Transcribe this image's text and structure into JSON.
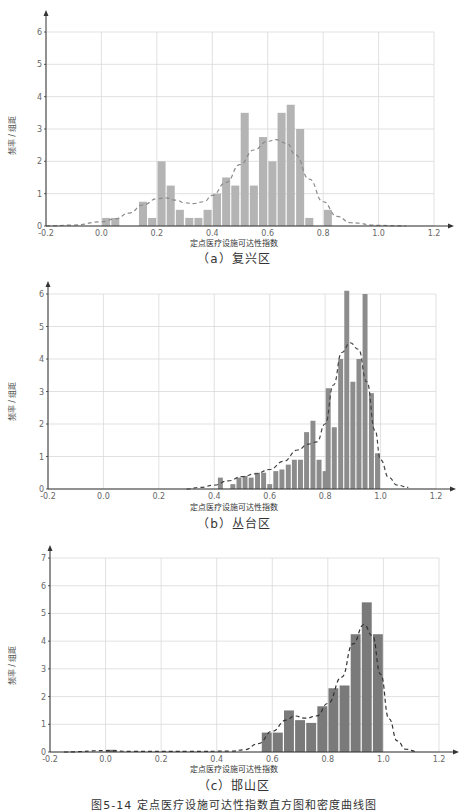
{
  "figure_caption": "图5-14  定点医疗设施可达性指数直方图和密度曲线图",
  "chart_data": [
    {
      "type": "bar",
      "subtype": "histogram_with_density_curve",
      "caption": "（a）复兴区",
      "xlabel": "定点医疗设施可达性指数",
      "ylabel": "频率 / 组距",
      "xlim": [
        -0.2,
        1.2
      ],
      "ylim": [
        0,
        6
      ],
      "xticks": [
        "-0.2",
        "0.0",
        "0.2",
        "0.4",
        "0.6",
        "0.8",
        "1.0",
        "1.2"
      ],
      "yticks": [
        "0",
        "1",
        "2",
        "3",
        "4",
        "5",
        "6"
      ],
      "grid": true,
      "bin_width": 0.0333,
      "bar_color": "#b4b4b4",
      "bins": [
        {
          "x": 0.017,
          "y": 0.25
        },
        {
          "x": 0.05,
          "y": 0.25
        },
        {
          "x": 0.15,
          "y": 0.75
        },
        {
          "x": 0.183,
          "y": 0.25
        },
        {
          "x": 0.217,
          "y": 2.0
        },
        {
          "x": 0.25,
          "y": 1.25
        },
        {
          "x": 0.283,
          "y": 0.5
        },
        {
          "x": 0.317,
          "y": 0.25
        },
        {
          "x": 0.35,
          "y": 0.25
        },
        {
          "x": 0.383,
          "y": 0.5
        },
        {
          "x": 0.417,
          "y": 1.0
        },
        {
          "x": 0.45,
          "y": 1.5
        },
        {
          "x": 0.483,
          "y": 1.25
        },
        {
          "x": 0.517,
          "y": 3.5
        },
        {
          "x": 0.55,
          "y": 1.25
        },
        {
          "x": 0.583,
          "y": 2.75
        },
        {
          "x": 0.617,
          "y": 2.0
        },
        {
          "x": 0.65,
          "y": 3.5
        },
        {
          "x": 0.683,
          "y": 3.75
        },
        {
          "x": 0.717,
          "y": 3.0
        },
        {
          "x": 0.75,
          "y": 0.25
        },
        {
          "x": 0.817,
          "y": 0.5
        }
      ],
      "density_curve": {
        "style": "dashed",
        "color": "#8a8a8a",
        "points": [
          [
            -0.2,
            0.0
          ],
          [
            -0.1,
            0.03
          ],
          [
            0.0,
            0.13
          ],
          [
            0.05,
            0.22
          ],
          [
            0.1,
            0.4
          ],
          [
            0.15,
            0.65
          ],
          [
            0.2,
            0.84
          ],
          [
            0.23,
            0.87
          ],
          [
            0.27,
            0.8
          ],
          [
            0.3,
            0.72
          ],
          [
            0.33,
            0.69
          ],
          [
            0.37,
            0.75
          ],
          [
            0.4,
            0.95
          ],
          [
            0.45,
            1.35
          ],
          [
            0.5,
            1.9
          ],
          [
            0.55,
            2.35
          ],
          [
            0.6,
            2.62
          ],
          [
            0.63,
            2.67
          ],
          [
            0.67,
            2.55
          ],
          [
            0.7,
            2.2
          ],
          [
            0.75,
            1.45
          ],
          [
            0.8,
            0.75
          ],
          [
            0.85,
            0.3
          ],
          [
            0.9,
            0.1
          ],
          [
            1.0,
            0.02
          ],
          [
            1.1,
            0.0
          ]
        ]
      }
    },
    {
      "type": "bar",
      "subtype": "histogram_with_density_curve",
      "caption": "（b）丛台区",
      "xlabel": "定点医疗设施可达性指数",
      "ylabel": "频率 / 组距",
      "xlim": [
        -0.2,
        1.2
      ],
      "ylim": [
        0,
        6
      ],
      "xticks": [
        "-0.2",
        "0.0",
        "0.2",
        "0.4",
        "0.6",
        "0.8",
        "1.0",
        "1.2"
      ],
      "yticks": [
        "0",
        "1",
        "2",
        "3",
        "4",
        "5",
        "6"
      ],
      "grid": true,
      "bin_width": 0.0222,
      "bar_color": "#8c8c8c",
      "bins": [
        {
          "x": 0.422,
          "y": 0.35
        },
        {
          "x": 0.467,
          "y": 0.15
        },
        {
          "x": 0.489,
          "y": 0.35
        },
        {
          "x": 0.511,
          "y": 0.4
        },
        {
          "x": 0.533,
          "y": 0.35
        },
        {
          "x": 0.556,
          "y": 0.5
        },
        {
          "x": 0.578,
          "y": 0.5
        },
        {
          "x": 0.6,
          "y": 0.15
        },
        {
          "x": 0.622,
          "y": 0.55
        },
        {
          "x": 0.644,
          "y": 0.6
        },
        {
          "x": 0.667,
          "y": 0.75
        },
        {
          "x": 0.689,
          "y": 0.9
        },
        {
          "x": 0.711,
          "y": 0.9
        },
        {
          "x": 0.733,
          "y": 1.75
        },
        {
          "x": 0.756,
          "y": 2.1
        },
        {
          "x": 0.778,
          "y": 0.9
        },
        {
          "x": 0.8,
          "y": 0.55
        },
        {
          "x": 0.811,
          "y": 3.1
        },
        {
          "x": 0.833,
          "y": 1.9
        },
        {
          "x": 0.856,
          "y": 4.0
        },
        {
          "x": 0.878,
          "y": 6.1
        },
        {
          "x": 0.9,
          "y": 3.3
        },
        {
          "x": 0.922,
          "y": 4.0
        },
        {
          "x": 0.944,
          "y": 6.0
        },
        {
          "x": 0.967,
          "y": 2.95
        },
        {
          "x": 0.989,
          "y": 1.1
        }
      ],
      "density_curve": {
        "style": "dashed",
        "color": "#444444",
        "points": [
          [
            0.3,
            0.0
          ],
          [
            0.35,
            0.05
          ],
          [
            0.4,
            0.12
          ],
          [
            0.45,
            0.25
          ],
          [
            0.5,
            0.38
          ],
          [
            0.55,
            0.47
          ],
          [
            0.6,
            0.6
          ],
          [
            0.65,
            0.85
          ],
          [
            0.7,
            1.2
          ],
          [
            0.74,
            1.38
          ],
          [
            0.77,
            1.45
          ],
          [
            0.8,
            2.0
          ],
          [
            0.83,
            3.2
          ],
          [
            0.86,
            4.2
          ],
          [
            0.89,
            4.5
          ],
          [
            0.92,
            4.3
          ],
          [
            0.95,
            3.3
          ],
          [
            0.98,
            1.8
          ],
          [
            1.0,
            0.9
          ],
          [
            1.03,
            0.35
          ],
          [
            1.06,
            0.12
          ],
          [
            1.1,
            0.05
          ]
        ]
      }
    },
    {
      "type": "bar",
      "subtype": "histogram_with_density_curve",
      "caption": "（c）邯山区",
      "xlabel": "定点医疗设施可达性指数",
      "ylabel": "频率 / 组距",
      "xlim": [
        -0.2,
        1.2
      ],
      "ylim": [
        0,
        7
      ],
      "xticks": [
        "-0.2",
        "0.0",
        "0.2",
        "0.4",
        "0.6",
        "0.8",
        "1.0",
        "1.2"
      ],
      "yticks": [
        "0",
        "1",
        "2",
        "3",
        "4",
        "5",
        "6",
        "7"
      ],
      "grid": true,
      "bin_width": 0.04,
      "bar_color": "#7a7a7a",
      "bins": [
        {
          "x": 0.02,
          "y": 0.08
        },
        {
          "x": 0.58,
          "y": 0.7
        },
        {
          "x": 0.62,
          "y": 0.7
        },
        {
          "x": 0.66,
          "y": 1.5
        },
        {
          "x": 0.7,
          "y": 1.15
        },
        {
          "x": 0.74,
          "y": 1.05
        },
        {
          "x": 0.78,
          "y": 1.65
        },
        {
          "x": 0.82,
          "y": 2.3
        },
        {
          "x": 0.86,
          "y": 2.4
        },
        {
          "x": 0.9,
          "y": 4.25
        },
        {
          "x": 0.94,
          "y": 5.4
        },
        {
          "x": 0.98,
          "y": 4.25
        }
      ],
      "density_curve": {
        "style": "dashed",
        "color": "#333333",
        "points": [
          [
            -0.15,
            0.0
          ],
          [
            0.0,
            0.05
          ],
          [
            0.1,
            0.02
          ],
          [
            0.3,
            0.02
          ],
          [
            0.45,
            0.03
          ],
          [
            0.5,
            0.08
          ],
          [
            0.55,
            0.3
          ],
          [
            0.6,
            0.75
          ],
          [
            0.65,
            1.15
          ],
          [
            0.68,
            1.3
          ],
          [
            0.72,
            1.22
          ],
          [
            0.76,
            1.3
          ],
          [
            0.8,
            1.75
          ],
          [
            0.85,
            2.7
          ],
          [
            0.89,
            3.9
          ],
          [
            0.93,
            4.6
          ],
          [
            0.96,
            4.2
          ],
          [
            0.99,
            2.8
          ],
          [
            1.02,
            1.2
          ],
          [
            1.05,
            0.4
          ],
          [
            1.08,
            0.1
          ],
          [
            1.12,
            0.02
          ]
        ]
      }
    }
  ]
}
